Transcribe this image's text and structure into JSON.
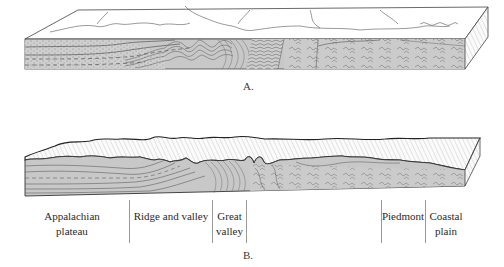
{
  "figure": {
    "panel_a": {
      "caption": "A.",
      "description": "Block diagram of folded sedimentary strata with crystalline rocks to the east, flat eroded surface"
    },
    "panel_b": {
      "caption": "B.",
      "description": "Block diagram of dissected landscape showing physiographic provinces",
      "regions": [
        {
          "id": "appalachian-plateau",
          "line1": "Appalachian",
          "line2": "plateau"
        },
        {
          "id": "ridge-and-valley",
          "line1": "Ridge and valley",
          "line2": ""
        },
        {
          "id": "great-valley",
          "line1": "Great",
          "line2": "valley"
        },
        {
          "id": "blue-ridge",
          "line1": "",
          "line2": ""
        },
        {
          "id": "piedmont",
          "line1": "Piedmont",
          "line2": ""
        },
        {
          "id": "coastal-plain",
          "line1": "Coastal",
          "line2": "plain"
        }
      ]
    },
    "colors": {
      "strata_fill": "#c8c8c8",
      "line": "#3a3a3a",
      "top_surface": "#ffffff",
      "divider": "#9a9a9a"
    }
  }
}
